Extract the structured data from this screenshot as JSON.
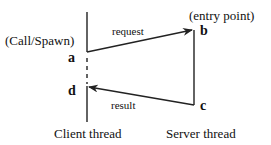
{
  "diagram": {
    "call_label": "(Call/Spawn)",
    "entry_label": "(entry point)",
    "points": {
      "a": "a",
      "b": "b",
      "c": "c",
      "d": "d"
    },
    "request_label": "request",
    "result_label": "result",
    "client_label": "Client thread",
    "server_label": "Server thread"
  }
}
